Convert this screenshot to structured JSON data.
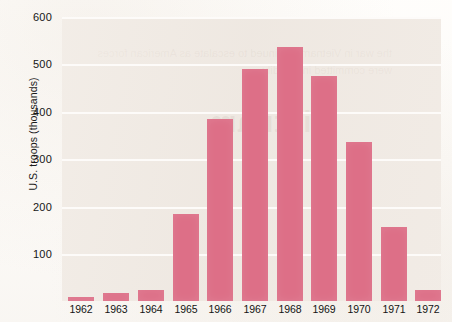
{
  "chart_data": {
    "type": "bar",
    "title": "",
    "subtitle": "",
    "xlabel": "",
    "ylabel": "U.S. troops (thousands)",
    "categories": [
      "1962",
      "1963",
      "1964",
      "1965",
      "1966",
      "1967",
      "1968",
      "1969",
      "1970",
      "1971",
      "1972"
    ],
    "values": [
      9,
      16,
      23,
      184,
      385,
      490,
      537,
      475,
      335,
      157,
      24
    ],
    "series": [
      {
        "name": "U.S. troops",
        "values": [
          9,
          16,
          23,
          184,
          385,
          490,
          537,
          475,
          335,
          157,
          24
        ]
      }
    ],
    "ylim": [
      0,
      600
    ],
    "ytick_labels": [
      "600",
      "500",
      "400",
      "300",
      "200",
      "100"
    ],
    "ytick_values": [
      600,
      500,
      400,
      300,
      200,
      100
    ],
    "grid": true,
    "grid_axis": "y",
    "legend": false,
    "legend_position": "none",
    "annotations": [],
    "colors": {
      "bar": "#dd6f87",
      "plot_background": "#efe9e3",
      "page_background": "#fefdfb",
      "gridline": "#fdfbf9",
      "text": "#161616"
    }
  },
  "artifacts": {
    "bleed_through_word": "Vietnam",
    "bleed_through_lines": "the war in Vietnam continued to escalate as American forces were committed in steadily"
  }
}
